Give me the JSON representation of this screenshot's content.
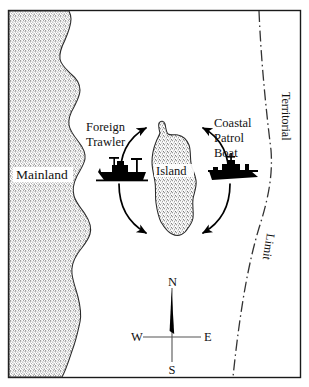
{
  "figure": {
    "type": "map-diagram",
    "title_visible": false,
    "background_color": "#ffffff",
    "frame_color": "#1a1a1a",
    "land_fill_color": "#c9c9c9",
    "land_outline_color": "#2a2a2a",
    "vessel_color": "#000000",
    "arrow_color": "#000000",
    "boundary_line_color": "#333333"
  },
  "labels": {
    "mainland": "Mainland",
    "island": "Island",
    "foreign_trawler_line1": "Foreign",
    "foreign_trawler_line2": "Trawler",
    "patrol_line1": "Coastal",
    "patrol_line2": "Patrol",
    "patrol_line3": "Boat",
    "boundary_upper": "Territorial",
    "boundary_lower": "Limit"
  },
  "compass": {
    "north": "N",
    "south": "S",
    "east": "E",
    "west": "W",
    "needle_points_to": "N"
  },
  "features": [
    {
      "name": "mainland",
      "kind": "landmass",
      "position": "west",
      "fill": "stippled"
    },
    {
      "name": "island",
      "kind": "landmass",
      "position": "center",
      "fill": "stippled"
    },
    {
      "name": "foreign-trawler",
      "kind": "vessel",
      "position": "west-of-island"
    },
    {
      "name": "coastal-patrol-boat",
      "kind": "vessel",
      "position": "east-of-island"
    },
    {
      "name": "territorial-limit",
      "kind": "boundary",
      "position": "east",
      "style": "dash-dot"
    },
    {
      "name": "circulation-arrows",
      "kind": "annotation",
      "count": 4
    }
  ]
}
